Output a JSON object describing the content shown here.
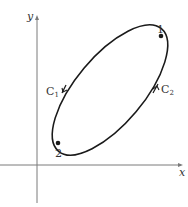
{
  "diagram": {
    "axes": {
      "x_label": "x",
      "y_label": "y"
    },
    "curve": {
      "type": "closed-ellipse",
      "points": [
        {
          "label": "1",
          "description": "upper-right point on curve"
        },
        {
          "label": "2",
          "description": "lower-left point on curve"
        }
      ],
      "paths": [
        {
          "label_main": "C",
          "label_sub": "1",
          "side": "left",
          "direction": "from 1 down to 2 (upper-left arc)"
        },
        {
          "label_main": "C",
          "label_sub": "2",
          "side": "right",
          "direction": "from 2 up to 1 (lower-right arc)"
        }
      ]
    },
    "colors": {
      "axis": "#7a7a7a",
      "curve": "#1a1a1a",
      "text": "#333333"
    }
  }
}
